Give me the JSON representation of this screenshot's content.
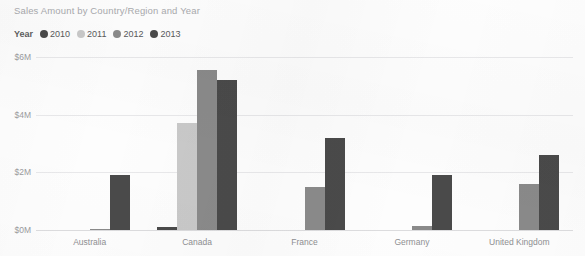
{
  "visual": {
    "title": "Sales Amount by Country/Region and Year",
    "background_color": "#fdfdfd"
  },
  "legend": {
    "title": "Year",
    "position": "top-left",
    "items": [
      {
        "label": "2010",
        "color": "#4a4a4a",
        "marker": "circle-marker"
      },
      {
        "label": "2011",
        "color": "#c9c9c9",
        "marker": "circle-marker"
      },
      {
        "label": "2012",
        "color": "#8a8a8a",
        "marker": "circle-marker"
      },
      {
        "label": "2013",
        "color": "#4a4a4a",
        "marker": "circle-marker"
      }
    ]
  },
  "axis": {
    "y_ticks": [
      "$6M",
      "$4M",
      "$2M",
      "$0M"
    ],
    "x_categories": [
      "Australia",
      "Canada",
      "France",
      "Germany",
      "United Kingdom"
    ]
  },
  "chart_data": {
    "type": "bar",
    "title": "Sales Amount by Country/Region and Year",
    "xlabel": "",
    "ylabel": "",
    "ylim": [
      0,
      6
    ],
    "y_unit": "$M",
    "y_ticks": [
      0,
      2,
      4,
      6
    ],
    "grid": true,
    "legend_position": "top-left",
    "legend_title": "Year",
    "categories": [
      "Australia",
      "Canada",
      "France",
      "Germany",
      "United Kingdom"
    ],
    "series": [
      {
        "name": "2010",
        "color": "#4a4a4a",
        "values": [
          0.0,
          0.1,
          0.0,
          0.0,
          0.0
        ]
      },
      {
        "name": "2011",
        "color": "#c9c9c9",
        "values": [
          0.0,
          3.7,
          0.0,
          0.0,
          0.0
        ]
      },
      {
        "name": "2012",
        "color": "#8a8a8a",
        "values": [
          0.05,
          5.55,
          1.5,
          0.15,
          1.6
        ]
      },
      {
        "name": "2013",
        "color": "#4a4a4a",
        "values": [
          1.9,
          5.2,
          3.2,
          1.9,
          2.6
        ]
      }
    ]
  }
}
